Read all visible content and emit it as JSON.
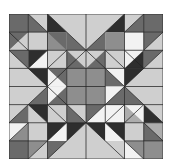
{
  "grid": {
    "cols": 8,
    "rows": 8
  },
  "palette": {
    "white": "#f2f2f2",
    "light": "#cfcfcf",
    "midlight": "#adadad",
    "mid": "#8e8e8e",
    "middark": "#6a6a6a",
    "dark": "#2e2e2e",
    "line": "#222222"
  },
  "shapes": [
    {
      "pts": "0,0 1,0 1,1 0,1",
      "c": "middark"
    },
    {
      "pts": "1,0 2,0 2,1",
      "c": "light"
    },
    {
      "pts": "1,0 2,1 1,1",
      "c": "middark"
    },
    {
      "pts": "2,0 4,0 4,2",
      "c": "light"
    },
    {
      "pts": "2,0 3,1 2,1",
      "c": "dark"
    },
    {
      "pts": "3,1 4,2 3,2",
      "c": "middark"
    },
    {
      "pts": "2,1 3,1 3,2 2,2",
      "c": "middark"
    },
    {
      "pts": "4,0 6,0 4,2",
      "c": "light"
    },
    {
      "pts": "6,0 5,1 6,1",
      "c": "dark"
    },
    {
      "pts": "5,1 4,2 5,2",
      "c": "middark"
    },
    {
      "pts": "5,1 6,1 6,2 5,2",
      "c": "mid"
    },
    {
      "pts": "6,0 7,0 6,1",
      "c": "light"
    },
    {
      "pts": "7,0 7,1 6,1",
      "c": "middark"
    },
    {
      "pts": "7,0 8,0 8,1 7,1",
      "c": "middark"
    },
    {
      "pts": "0,1 1,1 0,2",
      "c": "middark"
    },
    {
      "pts": "1,1 1,2 0,2",
      "c": "light"
    },
    {
      "pts": "1,1 2,1 2,2 1,2",
      "c": "light"
    },
    {
      "pts": "2,1 3,2 2,2",
      "c": "mid"
    },
    {
      "pts": "6,1 7,1 7,2 6,2",
      "c": "white"
    },
    {
      "pts": "7,1 8,1 7,2",
      "c": "middark"
    },
    {
      "pts": "8,1 8,2 7,2",
      "c": "light"
    },
    {
      "pts": "0,2 2,4 0,4",
      "c": "light"
    },
    {
      "pts": "0,2 1,2 1,3",
      "c": "middark"
    },
    {
      "pts": "1,2 2,2 1,3",
      "c": "dark"
    },
    {
      "pts": "2,2 2,3 1,3",
      "c": "white"
    },
    {
      "pts": "1,3 2,3 2,4",
      "c": "dark"
    },
    {
      "pts": "2,2 3,2 3,3 2,3",
      "c": "light"
    },
    {
      "pts": "2,3 3,3 3,4",
      "c": "middark"
    },
    {
      "pts": "2,3 3,4 2,4",
      "c": "white"
    },
    {
      "pts": "3,2 4,2 4,3",
      "c": "light"
    },
    {
      "pts": "3,2 4,3 3,3",
      "c": "middark"
    },
    {
      "pts": "4,2 5,2 4,3",
      "c": "light"
    },
    {
      "pts": "5,2 5,3 4,3",
      "c": "middark"
    },
    {
      "pts": "5,2 6,2 6,3 5,3",
      "c": "light"
    },
    {
      "pts": "6,2 7,2 6,3",
      "c": "white"
    },
    {
      "pts": "7,2 7,3 6,3",
      "c": "dark"
    },
    {
      "pts": "7,2 8,2 7,3",
      "c": "middark"
    },
    {
      "pts": "8,2 8,4 6,4",
      "c": "light"
    },
    {
      "pts": "7,3 6,4 6,3",
      "c": "dark"
    },
    {
      "pts": "5,3 6,3 6,4",
      "c": "white"
    },
    {
      "pts": "5,3 6,4 5,4",
      "c": "middark"
    },
    {
      "pts": "3,3 5,3 5,5 3,5",
      "c": "mid"
    },
    {
      "pts": "0,4 2,4 0,6",
      "c": "light"
    },
    {
      "pts": "2,4 1,5 2,5",
      "c": "middark"
    },
    {
      "pts": "2,4 3,4 2,5",
      "c": "white"
    },
    {
      "pts": "3,4 3,5 2,5",
      "c": "middark"
    },
    {
      "pts": "1,5 2,5 2,6",
      "c": "dark"
    },
    {
      "pts": "1,5 2,6 1,6",
      "c": "light"
    },
    {
      "pts": "0,6 1,5 1,6",
      "c": "middark"
    },
    {
      "pts": "2,5 3,5 3,6 2,6",
      "c": "light"
    },
    {
      "pts": "3,5 4,5 4,6",
      "c": "light"
    },
    {
      "pts": "3,5 4,6 3,6",
      "c": "middark"
    },
    {
      "pts": "4,5 5,5 4,6",
      "c": "middark"
    },
    {
      "pts": "5,5 5,6 4,6",
      "c": "white"
    },
    {
      "pts": "5,5 6,5 6,6 5,6",
      "c": "white"
    },
    {
      "pts": "5,4 6,4 5,5",
      "c": "white"
    },
    {
      "pts": "6,4 6,5 5,5",
      "c": "middark"
    },
    {
      "pts": "6,4 8,4 8,6",
      "c": "light"
    },
    {
      "pts": "6,4 7,5 6,5",
      "c": "middark"
    },
    {
      "pts": "6,5 7,5 7,6",
      "c": "white"
    },
    {
      "pts": "6,5 7,6 6,6",
      "c": "midlight"
    },
    {
      "pts": "7,5 8,6 7,6",
      "c": "dark"
    },
    {
      "pts": "0,6 1,6 1,7 0,7",
      "c": "white"
    },
    {
      "pts": "0,7 1,6 1,7",
      "c": "mid"
    },
    {
      "pts": "1,6 2,6 2,7 1,7",
      "c": "light"
    },
    {
      "pts": "2,6 3,6 2,7",
      "c": "dark"
    },
    {
      "pts": "3,6 3,7 2,7",
      "c": "white"
    },
    {
      "pts": "3,6 4,6 3,7",
      "c": "dark"
    },
    {
      "pts": "3,7 4,6 4,8 2,8",
      "c": "light"
    },
    {
      "pts": "4,6 5,6 5,7",
      "c": "dark"
    },
    {
      "pts": "4,6 5,7 4,8 6,8",
      "c": "light"
    },
    {
      "pts": "5,6 6,6 6,7",
      "c": "dark"
    },
    {
      "pts": "5,6 6,7 5,7",
      "c": "white"
    },
    {
      "pts": "6,6 7,6 7,7 6,7",
      "c": "light"
    },
    {
      "pts": "7,6 8,6 8,7 7,7",
      "c": "midlight"
    },
    {
      "pts": "7,6 8,7 7,7",
      "c": "middark"
    },
    {
      "pts": "0,7 1,7 1,8 0,8",
      "c": "middark"
    },
    {
      "pts": "1,7 2,7 1,8",
      "c": "mid"
    },
    {
      "pts": "2,7 2,8 1,8",
      "c": "light"
    },
    {
      "pts": "2,7 3,7 2,8",
      "c": "middark"
    },
    {
      "pts": "6,7 7,7 7,8",
      "c": "mid"
    },
    {
      "pts": "6,7 7,8 6,8",
      "c": "white"
    },
    {
      "pts": "7,7 8,7 8,8 7,8",
      "c": "mid"
    }
  ],
  "lines": [
    "0,0 8,0",
    "0,1 2,1",
    "6,1 8,1",
    "0,2 8,2",
    "0,3 8,3",
    "0,4 2,4",
    "6,4 8,4",
    "3,4 5,4",
    "0,5 8,5",
    "0,6 8,6",
    "0,7 2,7",
    "6,7 8,7",
    "0,8 8,8",
    "0,0 0,8",
    "1,0 1,2",
    "1,6 1,8",
    "2,0 2,8",
    "3,2 3,6",
    "4,0 4,8",
    "5,2 5,6",
    "6,0 6,8",
    "7,0 7,2",
    "7,6 7,8",
    "8,0 8,8",
    "2,0 4,2",
    "6,0 4,2",
    "0,2 2,4",
    "0,6 2,4",
    "8,2 6,4",
    "8,6 6,4",
    "2,8 4,6",
    "6,8 4,6",
    "1,0 2,1",
    "6,1 7,0",
    "0,1 1,2",
    "7,2 8,1",
    "1,3 2,2",
    "6,2 7,3",
    "1,5 2,6",
    "7,5 6,6",
    "2,7 3,6",
    "5,6 6,7",
    "0,7 1,6",
    "7,6 8,7",
    "1,8 2,7",
    "6,7 7,8",
    "3,3 4,2",
    "4,2 5,3",
    "3,3 2,4",
    "5,3 6,4",
    "2,4 3,5",
    "6,4 5,5",
    "3,5 4,6",
    "4,6 5,5",
    "3,2 2,3",
    "5,2 6,3",
    "2,5 3,6",
    "6,5 5,6"
  ]
}
